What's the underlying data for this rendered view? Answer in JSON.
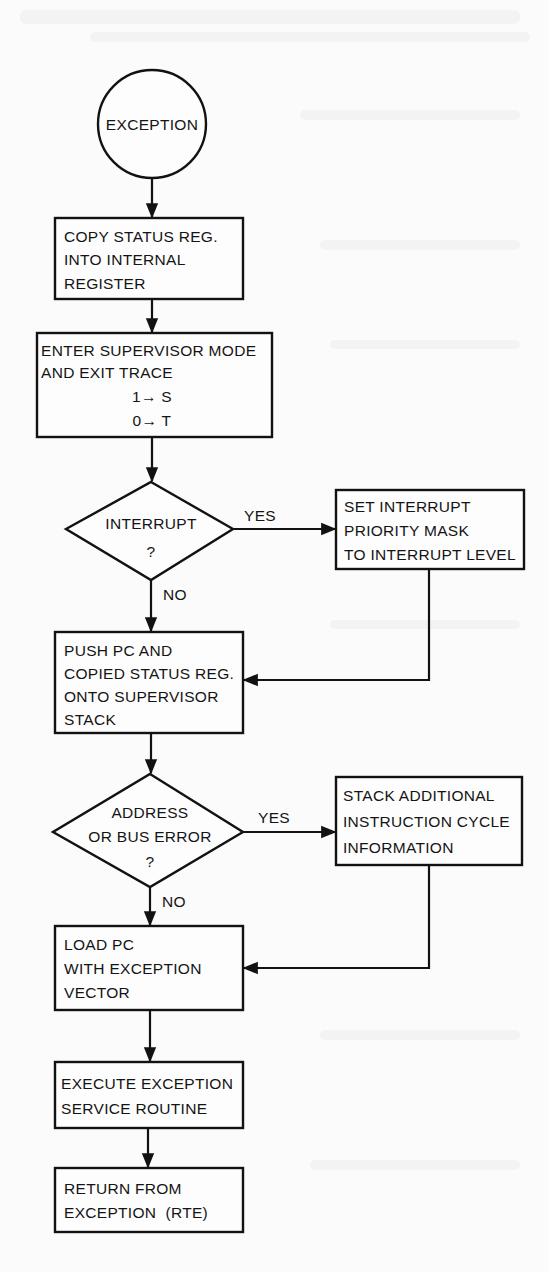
{
  "diagram": {
    "type": "flowchart",
    "start": {
      "label": "EXCEPTION"
    },
    "nodes": [
      {
        "id": "copy_sr",
        "lines": [
          "COPY STATUS REG.",
          "INTO INTERNAL",
          "REGISTER"
        ]
      },
      {
        "id": "enter_super",
        "lines": [
          "ENTER SUPERVISOR MODE",
          "AND EXIT TRACE",
          "1→ S",
          "0→ T"
        ]
      },
      {
        "id": "interrupt_decision",
        "lines": [
          "INTERRUPT",
          "?"
        ],
        "yes_label": "YES",
        "no_label": "NO"
      },
      {
        "id": "set_mask",
        "lines": [
          "SET INTERRUPT",
          "PRIORITY MASK",
          "TO INTERRUPT LEVEL"
        ]
      },
      {
        "id": "push_pc",
        "lines": [
          "PUSH PC AND",
          "COPIED STATUS REG.",
          "ONTO SUPERVISOR",
          "STACK"
        ]
      },
      {
        "id": "bus_error_decision",
        "lines": [
          "ADDRESS",
          "OR BUS ERROR",
          "?"
        ],
        "yes_label": "YES",
        "no_label": "NO"
      },
      {
        "id": "stack_info",
        "lines": [
          "STACK ADDITIONAL",
          "INSTRUCTION CYCLE",
          "INFORMATION"
        ]
      },
      {
        "id": "load_pc",
        "lines": [
          "LOAD PC",
          "WITH EXCEPTION",
          "VECTOR"
        ]
      },
      {
        "id": "execute",
        "lines": [
          "EXECUTE EXCEPTION",
          "SERVICE ROUTINE"
        ]
      },
      {
        "id": "rte",
        "lines": [
          "RETURN FROM",
          "EXCEPTION  (RTE)"
        ]
      }
    ],
    "edges": [
      {
        "from": "start",
        "to": "copy_sr"
      },
      {
        "from": "copy_sr",
        "to": "enter_super"
      },
      {
        "from": "enter_super",
        "to": "interrupt_decision"
      },
      {
        "from": "interrupt_decision",
        "to": "set_mask",
        "label": "YES"
      },
      {
        "from": "interrupt_decision",
        "to": "push_pc",
        "label": "NO"
      },
      {
        "from": "set_mask",
        "to": "push_pc"
      },
      {
        "from": "push_pc",
        "to": "bus_error_decision"
      },
      {
        "from": "bus_error_decision",
        "to": "stack_info",
        "label": "YES"
      },
      {
        "from": "bus_error_decision",
        "to": "load_pc",
        "label": "NO"
      },
      {
        "from": "stack_info",
        "to": "load_pc"
      },
      {
        "from": "load_pc",
        "to": "execute"
      },
      {
        "from": "execute",
        "to": "rte"
      }
    ],
    "colors": {
      "ink": "#121212",
      "paper": "#fbfbfb"
    }
  }
}
